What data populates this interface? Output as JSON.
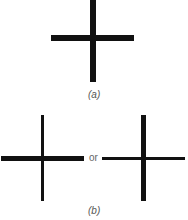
{
  "figure": {
    "panel_a": {
      "label": "(a)",
      "description": "cross with equal-weight strokes"
    },
    "panel_b": {
      "label": "(b)",
      "connector": "or",
      "left_cross": "thick horizontal, thin vertical",
      "right_cross": "thin horizontal, thick vertical"
    },
    "colors": {
      "stroke": "#111111",
      "text": "#555555",
      "background": "#ffffff"
    }
  }
}
